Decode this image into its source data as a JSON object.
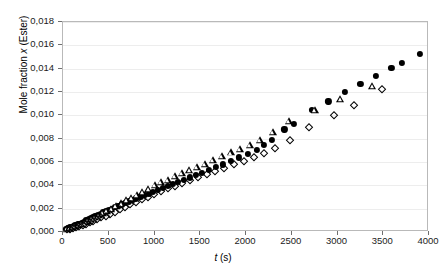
{
  "chart_data": {
    "type": "scatter",
    "title": "",
    "xlabel": "t (s)",
    "xlabel_var": "t",
    "xlabel_unit": "(s)",
    "ylabel": "Mole fraction x (Ester)",
    "ylabel_pre": "Mole fraction ",
    "ylabel_var": "x",
    "ylabel_post": " (Ester)",
    "xlim": [
      0,
      4000
    ],
    "ylim": [
      0,
      0.018
    ],
    "xticks": [
      0,
      500,
      1000,
      1500,
      2000,
      2500,
      3000,
      3500,
      4000
    ],
    "xtick_labels": [
      "0",
      "500",
      "1000",
      "1500",
      "2000",
      "2500",
      "3000",
      "3500",
      "4000"
    ],
    "yticks": [
      0,
      0.002,
      0.004,
      0.006,
      0.008,
      0.01,
      0.012,
      0.014,
      0.016,
      0.018
    ],
    "ytick_labels": [
      "0,000",
      "0,002",
      "0,004",
      "0,006",
      "0,008",
      "0,010",
      "0,012",
      "0,014",
      "0,016",
      "0,018"
    ],
    "grid": "horizontal",
    "grid_color": "#ededed",
    "frame_color": "#b9b9b9",
    "legend": "none",
    "decimal_separator": ",",
    "marker_color": "#000000",
    "series": [
      {
        "name": "series-filled-circle",
        "marker": "filled-circle",
        "points": [
          [
            30,
            0.0003
          ],
          [
            55,
            0.00035
          ],
          [
            75,
            0.0004
          ],
          [
            95,
            0.00045
          ],
          [
            115,
            0.00052
          ],
          [
            135,
            0.00058
          ],
          [
            160,
            0.00065
          ],
          [
            180,
            0.00072
          ],
          [
            205,
            0.0008
          ],
          [
            230,
            0.0009
          ],
          [
            255,
            0.001
          ],
          [
            280,
            0.0011
          ],
          [
            305,
            0.0012
          ],
          [
            330,
            0.00128
          ],
          [
            355,
            0.00137
          ],
          [
            385,
            0.00148
          ],
          [
            410,
            0.00158
          ],
          [
            440,
            0.00168
          ],
          [
            470,
            0.00178
          ],
          [
            500,
            0.0019
          ],
          [
            535,
            0.002
          ],
          [
            570,
            0.00212
          ],
          [
            605,
            0.00224
          ],
          [
            640,
            0.00236
          ],
          [
            680,
            0.0025
          ],
          [
            720,
            0.00262
          ],
          [
            760,
            0.00276
          ],
          [
            800,
            0.00288
          ],
          [
            845,
            0.00302
          ],
          [
            890,
            0.00316
          ],
          [
            935,
            0.0033
          ],
          [
            985,
            0.00345
          ],
          [
            1035,
            0.0036
          ],
          [
            1090,
            0.00378
          ],
          [
            1145,
            0.00395
          ],
          [
            1200,
            0.0041
          ],
          [
            1260,
            0.0043
          ],
          [
            1320,
            0.00448
          ],
          [
            1385,
            0.00468
          ],
          [
            1450,
            0.00487
          ],
          [
            1520,
            0.0051
          ],
          [
            1595,
            0.00535
          ],
          [
            1670,
            0.00558
          ],
          [
            1750,
            0.0058
          ],
          [
            1835,
            0.0061
          ],
          [
            1925,
            0.0064
          ],
          [
            2020,
            0.00672
          ],
          [
            2120,
            0.00705
          ],
          [
            2200,
            0.00745
          ],
          [
            2280,
            0.0079
          ],
          [
            2420,
            0.0088
          ],
          [
            2520,
            0.0093
          ],
          [
            2720,
            0.0105
          ],
          [
            2900,
            0.0112
          ],
          [
            3080,
            0.012
          ],
          [
            3250,
            0.0127
          ],
          [
            3420,
            0.0134
          ],
          [
            3590,
            0.0141
          ],
          [
            3700,
            0.0145
          ],
          [
            3900,
            0.0153
          ]
        ]
      },
      {
        "name": "series-open-triangle",
        "marker": "open-triangle",
        "points": [
          [
            40,
            0.00028
          ],
          [
            70,
            0.00034
          ],
          [
            100,
            0.00042
          ],
          [
            130,
            0.0005
          ],
          [
            165,
            0.0006
          ],
          [
            200,
            0.0007
          ],
          [
            235,
            0.00082
          ],
          [
            270,
            0.00095
          ],
          [
            310,
            0.0011
          ],
          [
            350,
            0.00125
          ],
          [
            390,
            0.00142
          ],
          [
            435,
            0.0016
          ],
          [
            480,
            0.00178
          ],
          [
            530,
            0.00198
          ],
          [
            580,
            0.0022
          ],
          [
            635,
            0.00245
          ],
          [
            690,
            0.00272
          ],
          [
            745,
            0.00295
          ],
          [
            805,
            0.0032
          ],
          [
            865,
            0.00345
          ],
          [
            930,
            0.00372
          ],
          [
            1000,
            0.004
          ],
          [
            1070,
            0.00428
          ],
          [
            1145,
            0.0045
          ],
          [
            1220,
            0.00478
          ],
          [
            1300,
            0.00505
          ],
          [
            1380,
            0.0053
          ],
          [
            1465,
            0.00555
          ],
          [
            1550,
            0.00585
          ],
          [
            1640,
            0.00615
          ],
          [
            1735,
            0.00648
          ],
          [
            1835,
            0.00682
          ],
          [
            1935,
            0.00715
          ],
          [
            2040,
            0.0075
          ],
          [
            2150,
            0.0079
          ],
          [
            2290,
            0.0086
          ],
          [
            2470,
            0.0095
          ],
          [
            2750,
            0.0105
          ],
          [
            3030,
            0.0114
          ],
          [
            3380,
            0.0125
          ]
        ]
      },
      {
        "name": "series-open-diamond",
        "marker": "open-diamond",
        "points": [
          [
            45,
            0.00022
          ],
          [
            80,
            0.00028
          ],
          [
            110,
            0.00034
          ],
          [
            145,
            0.00042
          ],
          [
            180,
            0.0005
          ],
          [
            215,
            0.0006
          ],
          [
            250,
            0.0007
          ],
          [
            290,
            0.00082
          ],
          [
            330,
            0.00095
          ],
          [
            375,
            0.0011
          ],
          [
            420,
            0.00125
          ],
          [
            465,
            0.0014
          ],
          [
            515,
            0.00158
          ],
          [
            565,
            0.00175
          ],
          [
            620,
            0.00195
          ],
          [
            675,
            0.00215
          ],
          [
            735,
            0.00238
          ],
          [
            795,
            0.00258
          ],
          [
            860,
            0.0028
          ],
          [
            925,
            0.00302
          ],
          [
            995,
            0.00325
          ],
          [
            1070,
            0.0035
          ],
          [
            1145,
            0.00375
          ],
          [
            1225,
            0.00398
          ],
          [
            1305,
            0.0042
          ],
          [
            1390,
            0.00445
          ],
          [
            1480,
            0.0047
          ],
          [
            1570,
            0.00495
          ],
          [
            1665,
            0.00522
          ],
          [
            1765,
            0.0055
          ],
          [
            1870,
            0.0058
          ],
          [
            1975,
            0.00612
          ],
          [
            2085,
            0.00645
          ],
          [
            2200,
            0.0068
          ],
          [
            2320,
            0.0072
          ],
          [
            2480,
            0.0079
          ],
          [
            2690,
            0.009
          ],
          [
            2960,
            0.01
          ],
          [
            3180,
            0.0109
          ],
          [
            3490,
            0.0123
          ]
        ]
      }
    ]
  }
}
